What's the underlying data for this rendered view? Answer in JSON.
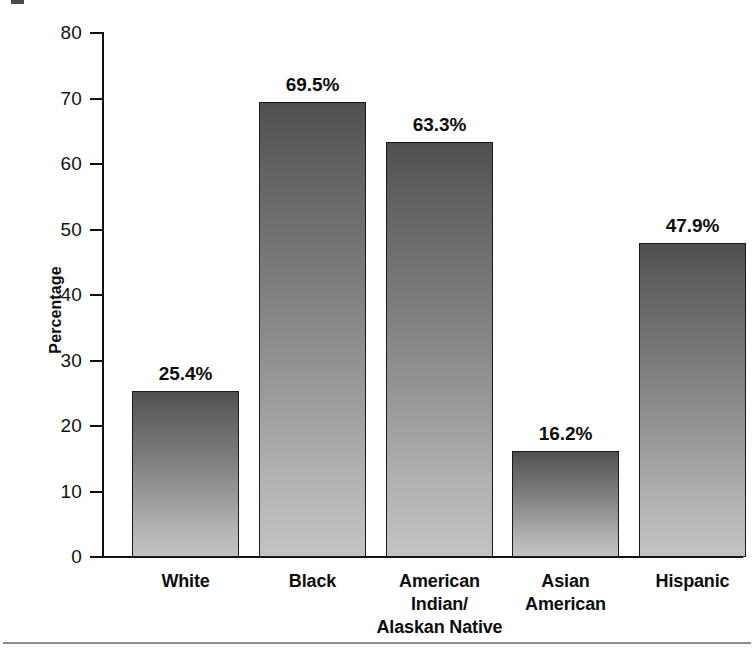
{
  "chart_data": {
    "type": "bar",
    "title": "",
    "xlabel": "",
    "ylabel": "Percentage",
    "ylim": [
      0,
      80
    ],
    "yticks": [
      0,
      10,
      20,
      30,
      40,
      50,
      60,
      70,
      80
    ],
    "ytick_labels": [
      "0",
      "10",
      "20",
      "30",
      "40",
      "50",
      "60",
      "70",
      "80"
    ],
    "grid": false,
    "legend": null,
    "value_label_suffix": "%",
    "categories": [
      "White",
      "American Indian/\nAlaskan Native",
      "Black",
      "Asian\nAmerican",
      "Hispanic"
    ],
    "series": [
      {
        "name": "Percentage",
        "values": [
          25.4,
          69.5,
          63.3,
          16.2,
          47.9
        ]
      }
    ],
    "points": [
      {
        "category": "White",
        "category_line1": "White",
        "category_line2": "",
        "value": 25.4,
        "label": "25.4%"
      },
      {
        "category": "Black",
        "category_line1": "Black",
        "category_line2": "",
        "value": 69.5,
        "label": "69.5%"
      },
      {
        "category": "American Indian/ Alaskan Native",
        "category_line1": "American Indian/",
        "category_line2": "Alaskan Native",
        "value": 63.3,
        "label": "63.3%"
      },
      {
        "category": "Asian American",
        "category_line1": "Asian",
        "category_line2": "American",
        "value": 16.2,
        "label": "16.2%"
      },
      {
        "category": "Hispanic",
        "category_line1": "Hispanic",
        "category_line2": "",
        "value": 47.9,
        "label": "47.9%"
      }
    ],
    "colors": {
      "bar_top": "#4f4f4f",
      "bar_bottom": "#c3c3c3",
      "bar_border": "#1a1a1a",
      "axis": "#111111",
      "text": "#0e0e0e",
      "rule": "#8d8d8d",
      "background": "#ffffff"
    }
  }
}
